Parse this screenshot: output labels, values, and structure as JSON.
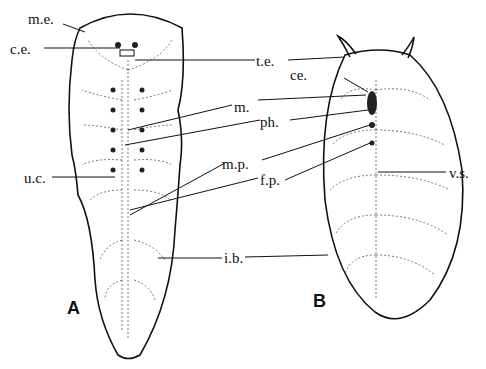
{
  "figure": {
    "panels": [
      {
        "id": "A",
        "label": "A"
      },
      {
        "id": "B",
        "label": "B"
      }
    ],
    "labels": {
      "me": "m.e.",
      "ce_a": "c.e.",
      "te": "t.e.",
      "ce_b": "ce.",
      "m": "m.",
      "ph": "ph.",
      "mp": "m.p.",
      "fp": "f.p.",
      "uc": "u.c.",
      "vs": "v.s.",
      "ib": "i.b."
    }
  }
}
